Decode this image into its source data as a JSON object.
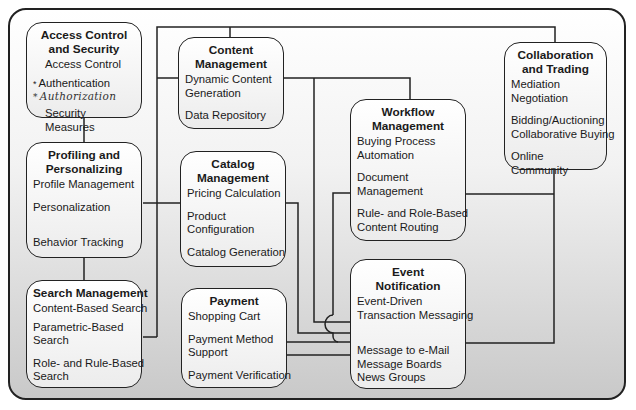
{
  "diagram": {
    "boxes": {
      "access": {
        "title_1": "Access Control",
        "title_2": "and Security",
        "items": [
          "Access Control",
          "Authentication",
          "Authorization",
          "Security Measures"
        ],
        "annotation_marks": [
          "*",
          "*"
        ]
      },
      "content": {
        "title_1": "Content",
        "title_2": "Management",
        "items": [
          "Dynamic Content",
          "Generation",
          "Data Repository"
        ]
      },
      "collab": {
        "title_1": "Collaboration",
        "title_2": "and Trading",
        "items": [
          "Mediation",
          "Negotiation",
          "Bidding/Auctioning",
          "Collaborative Buying",
          "Online Community"
        ]
      },
      "workflow": {
        "title_1": "Workflow",
        "title_2": "Management",
        "items": [
          "Buying Process",
          "Automation",
          "Document",
          "Management",
          "Rule- and Role-Based",
          "Content Routing"
        ]
      },
      "profiling": {
        "title_1": "Profiling and",
        "title_2": "Personalizing",
        "items": [
          "Profile Management",
          "Personalization",
          "Behavior Tracking"
        ]
      },
      "catalog": {
        "title_1": "Catalog",
        "title_2": "Management",
        "items": [
          "Pricing Calculation",
          "Product",
          "Configuration",
          "Catalog Generation"
        ]
      },
      "search": {
        "title_1": "Search Management",
        "items": [
          "Content-Based Search",
          "Parametric-Based",
          "Search",
          "Role- and Rule-Based",
          "Search"
        ]
      },
      "payment": {
        "title_1": "Payment",
        "items": [
          "Shopping Cart",
          "Payment Method",
          "Support",
          "Payment Verification"
        ]
      },
      "event": {
        "title_1": "Event",
        "title_2": "Notification",
        "items": [
          "Event-Driven",
          "Transaction Messaging",
          "Message to e-Mail",
          "Message Boards",
          "News Groups"
        ]
      }
    },
    "colors": {
      "line": "#222222",
      "box_fill_top": "#ffffff",
      "box_fill_bottom": "#ececec",
      "frame_bottom": "#c9c9c9"
    }
  }
}
